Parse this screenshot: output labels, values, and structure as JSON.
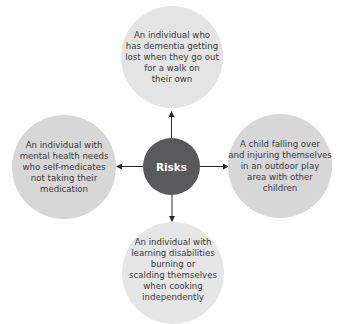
{
  "diagram": {
    "center": {
      "label": "Risks",
      "color": "#59595b"
    },
    "nodes": {
      "top": {
        "label": "An individual who\nhas dementia getting\nlost when they go out\nfor a walk on\ntheir own"
      },
      "left": {
        "label": "An individual with\nmental health needs\nwho self-medicates\nnot taking their\nmedication"
      },
      "right": {
        "label": "A child falling over\nand injuring themselves\nin an outdoor play\narea with other\nchildren"
      },
      "bottom": {
        "label": "An individual with\nlearning disabilities\nburning or\nscalding themselves\nwhen cooking\nindependently"
      }
    },
    "colors": {
      "outer_light": "#e4e4e4",
      "outer_mid": "#d7d7d7",
      "arrow": "#2a2a2a",
      "text": "#3a3a3a"
    }
  }
}
